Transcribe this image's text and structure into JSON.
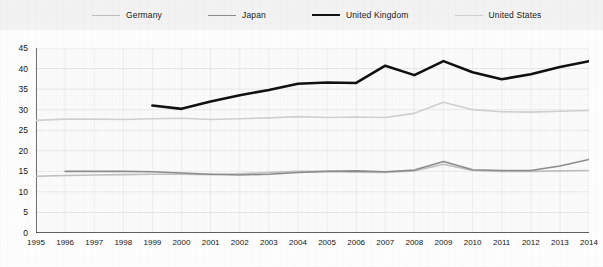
{
  "legend": {
    "position": "top",
    "items": [
      {
        "label": "Germany",
        "color": "#bfbfbf",
        "width": 1.6
      },
      {
        "label": "Japan",
        "color": "#8c8c8c",
        "width": 1.6
      },
      {
        "label": "United Kingdom",
        "color": "#111111",
        "width": 2.6
      },
      {
        "label": "United States",
        "color": "#cfcfcf",
        "width": 1.6
      }
    ]
  },
  "axes": {
    "ylim": [
      0,
      45
    ],
    "yticks": [
      0,
      5,
      10,
      15,
      20,
      25,
      30,
      35,
      40,
      45
    ],
    "xticks": [
      1995,
      1996,
      1997,
      1998,
      1999,
      2000,
      2001,
      2002,
      2003,
      2004,
      2005,
      2006,
      2007,
      2008,
      2009,
      2010,
      2011,
      2012,
      2013,
      2014
    ],
    "grid": true
  },
  "chart_data": {
    "type": "line",
    "title": "",
    "xlabel": "",
    "ylabel": "",
    "ylim": [
      0,
      45
    ],
    "grid": true,
    "legend_position": "top",
    "x": [
      1995,
      1996,
      1997,
      1998,
      1999,
      2000,
      2001,
      2002,
      2003,
      2004,
      2005,
      2006,
      2007,
      2008,
      2009,
      2010,
      2011,
      2012,
      2013,
      2014
    ],
    "series": [
      {
        "name": "Germany",
        "color": "#bfbfbf",
        "values": [
          13.8,
          14.0,
          14.1,
          14.2,
          14.3,
          14.3,
          14.2,
          14.4,
          14.7,
          15.0,
          15.0,
          14.8,
          14.7,
          15.1,
          16.7,
          15.2,
          15.0,
          15.0,
          15.1,
          15.2
        ]
      },
      {
        "name": "Japan",
        "color": "#8c8c8c",
        "values": [
          null,
          15.0,
          15.0,
          15.0,
          14.9,
          14.6,
          14.3,
          14.1,
          14.3,
          14.7,
          15.0,
          15.1,
          14.9,
          15.3,
          17.4,
          15.4,
          15.2,
          15.2,
          16.3,
          17.9
        ]
      },
      {
        "name": "United Kingdom",
        "color": "#111111",
        "values": [
          null,
          null,
          null,
          null,
          31.0,
          30.2,
          32.0,
          33.5,
          34.8,
          36.3,
          36.6,
          36.5,
          40.7,
          38.4,
          41.8,
          39.1,
          37.4,
          38.6,
          40.4,
          41.8
        ]
      },
      {
        "name": "United States",
        "color": "#cfcfcf",
        "values": [
          27.4,
          27.7,
          27.7,
          27.6,
          27.8,
          27.9,
          27.6,
          27.8,
          28.0,
          28.3,
          28.1,
          28.2,
          28.1,
          29.1,
          31.8,
          30.0,
          29.5,
          29.4,
          29.6,
          29.8
        ]
      }
    ]
  }
}
